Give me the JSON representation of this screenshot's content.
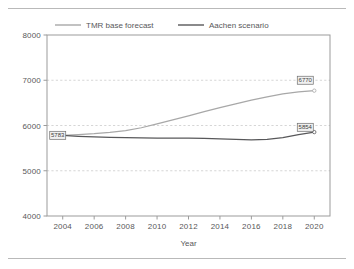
{
  "figure": {
    "top_rule": "hr-top",
    "bottom_rule": "hr-bottom"
  },
  "chart_data": {
    "type": "line",
    "title": "",
    "xlabel": "Year",
    "ylabel": "",
    "xlim": [
      2003,
      2021
    ],
    "ylim": [
      4000,
      8000
    ],
    "grid": true,
    "gridlines_y": [
      5000,
      6000,
      7000
    ],
    "legend_position": "top-center",
    "x_ticks": [
      2004,
      2006,
      2008,
      2010,
      2012,
      2014,
      2016,
      2018,
      2020
    ],
    "x_tick_labels": [
      "2004",
      "2006",
      "2008",
      "2010",
      "2012",
      "2014",
      "2016",
      "2018",
      "2020"
    ],
    "y_ticks": [
      4000,
      5000,
      6000,
      7000,
      8000
    ],
    "y_tick_labels": [
      "4000",
      "5000",
      "6000",
      "7000",
      "8000"
    ],
    "x": [
      2004,
      2005,
      2006,
      2007,
      2008,
      2009,
      2010,
      2011,
      2012,
      2013,
      2014,
      2015,
      2016,
      2017,
      2018,
      2019,
      2020
    ],
    "series": [
      {
        "name": "TMR base forecast",
        "color": "#a8a8a8",
        "values": [
          5783,
          5800,
          5820,
          5848,
          5885,
          5950,
          6035,
          6125,
          6215,
          6305,
          6395,
          6480,
          6560,
          6635,
          6700,
          6745,
          6770
        ]
      },
      {
        "name": "Aachen scenario",
        "color": "#58585a",
        "values": [
          5783,
          5762,
          5748,
          5738,
          5730,
          5725,
          5722,
          5721,
          5720,
          5716,
          5706,
          5692,
          5683,
          5692,
          5730,
          5800,
          5854
        ]
      }
    ],
    "point_labels": [
      {
        "name": "start-value-label",
        "text": "5783",
        "x": 2004,
        "y": 5783,
        "anchor": "left"
      },
      {
        "name": "tmr-end-value-label",
        "text": "6770",
        "x": 2020,
        "y": 7000,
        "anchor": "right"
      },
      {
        "name": "aachen-end-value-label",
        "text": "5854",
        "x": 2020,
        "y": 5960,
        "anchor": "right"
      }
    ]
  },
  "legend": {
    "items": [
      {
        "label": "TMR base forecast",
        "color": "#a8a8a8"
      },
      {
        "label": "Aachen scenario",
        "color": "#58585a"
      }
    ]
  }
}
